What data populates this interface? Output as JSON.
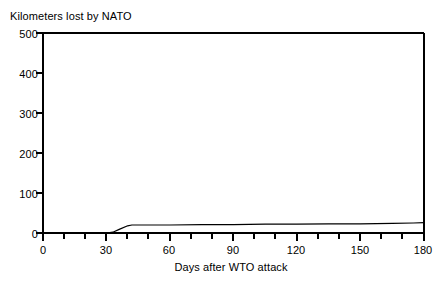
{
  "chart_data": {
    "type": "line",
    "title": "Kilometers lost by NATO",
    "xlabel": "Days after WTO attack",
    "ylabel": "",
    "xlim": [
      0,
      180
    ],
    "ylim": [
      0,
      500
    ],
    "grid": false,
    "legend": "none",
    "x_ticks": [
      0,
      30,
      60,
      90,
      120,
      150,
      180
    ],
    "x_tick_labels": [
      "0",
      "30",
      "60",
      "90",
      "120",
      "150",
      "180"
    ],
    "x_minor_tick_step": 10,
    "y_ticks": [
      0,
      100,
      200,
      300,
      400,
      500
    ],
    "y_tick_labels": [
      "0",
      "100",
      "200",
      "300",
      "400",
      "500"
    ],
    "series": [
      {
        "name": "Kilometers lost by NATO",
        "x": [
          0,
          10,
          20,
          30,
          33,
          36,
          40,
          42,
          50,
          60,
          75,
          90,
          105,
          120,
          135,
          150,
          165,
          175,
          180
        ],
        "values": [
          0,
          0,
          0,
          0,
          2,
          9,
          18,
          20,
          20,
          20,
          21,
          21,
          22,
          22,
          23,
          23,
          24,
          25,
          26
        ]
      }
    ]
  },
  "colors": {
    "line": "#000000",
    "axis": "#000000",
    "background": "#ffffff"
  }
}
